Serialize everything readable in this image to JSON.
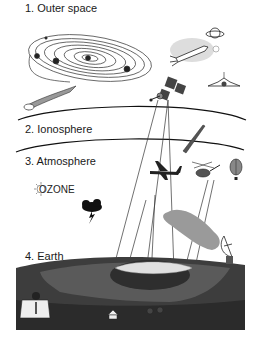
{
  "layers": [
    {
      "label": "1. Outer space"
    },
    {
      "label": "2. Ionosphere"
    },
    {
      "label": "3. Atmosphere"
    },
    {
      "label": "4. Earth"
    }
  ],
  "annotations": {
    "ozone": "OZONE"
  },
  "illustrations": {
    "outer_space": [
      "solar-system",
      "comet",
      "rocket",
      "planet-saturn",
      "moon",
      "space-shuttle",
      "satellite"
    ],
    "ionosphere": [
      "missile"
    ],
    "atmosphere": [
      "airplane",
      "helicopter",
      "hot-air-balloon",
      "sun-ozone",
      "storm-cloud"
    ],
    "earth": [
      "person-at-desk",
      "city",
      "lake-ice",
      "houses",
      "forest",
      "satellite-dish",
      "smoke-plume"
    ]
  },
  "colors": {
    "ink": "#1a1a1a",
    "earth_dark": "#3d3d3d",
    "earth_mid": "#5a5a5a",
    "smoke": "#8c8c8c",
    "background": "#ffffff"
  }
}
